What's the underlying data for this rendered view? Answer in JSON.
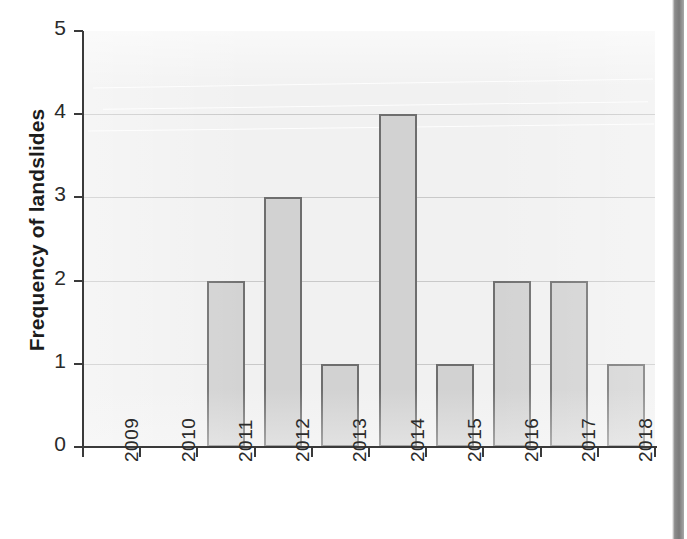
{
  "chart_data": {
    "type": "bar",
    "title": "",
    "xlabel": "",
    "ylabel": "Frequency of landslides",
    "categories": [
      "2009",
      "2010",
      "2011",
      "2012",
      "2013",
      "2014",
      "2015",
      "2016",
      "2017",
      "2018"
    ],
    "values": [
      0,
      0,
      2,
      3,
      1,
      4,
      1,
      2,
      2,
      1
    ],
    "ylim": [
      0,
      5
    ],
    "yticks": [
      "0",
      "1",
      "2",
      "3",
      "4",
      "5"
    ],
    "grid": "horizontal",
    "legend": "none",
    "bar_fill_color": "#d2d2d2",
    "bar_edge_color": "#6e6e6e",
    "plot_background_color": "#f1f1f1",
    "axis_color": "#3a3a3a",
    "gridline_color": "#c9c9c9"
  }
}
